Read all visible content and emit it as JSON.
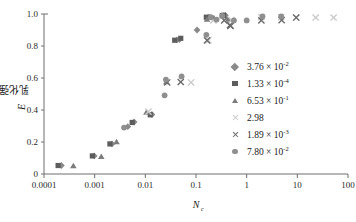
{
  "chart_data": {
    "type": "scatter",
    "title": "",
    "xlabel": "N",
    "xlabel_sub": "c",
    "ylabel": "乳化强度",
    "ylabel_italic": "E",
    "xscale": "log",
    "xlim": [
      0.0001,
      100
    ],
    "ylim": [
      0,
      1.0
    ],
    "grid": false,
    "legend_position": "right-middle",
    "xticks": [
      "0.0001",
      "0.001",
      "0.01",
      "0.1",
      "1",
      "10",
      "100"
    ],
    "xtick_values": [
      0.0001,
      0.001,
      0.01,
      0.1,
      1,
      10,
      100
    ],
    "yticks": [
      "0",
      "0.2",
      "0.4",
      "0.6",
      "0.8",
      "1.0"
    ],
    "ytick_values": [
      0,
      0.2,
      0.4,
      0.6,
      0.8,
      1.0
    ],
    "series": [
      {
        "name": "3.76 × 10⁻²",
        "mantissa": "3.76",
        "exponent": "-2",
        "marker": "diamond",
        "color": "#8a8a8a",
        "points": [
          [
            0.00022,
            0.053
          ],
          [
            0.00098,
            0.113
          ],
          [
            0.0022,
            0.188
          ],
          [
            0.0045,
            0.296
          ],
          [
            0.006,
            0.325
          ],
          [
            0.0135,
            0.372
          ],
          [
            0.042,
            0.838
          ],
          [
            0.047,
            0.84
          ],
          [
            0.105,
            0.9
          ],
          [
            0.175,
            0.98
          ],
          [
            0.345,
            0.99
          ],
          [
            0.38,
            0.992
          ]
        ]
      },
      {
        "name": "1.33 × 10⁻⁴",
        "mantissa": "1.33",
        "exponent": "-4",
        "marker": "square",
        "color": "#5d5d5d",
        "points": [
          [
            0.00019,
            0.053
          ],
          [
            0.0009,
            0.113
          ],
          [
            0.002,
            0.188
          ],
          [
            0.0055,
            0.322
          ],
          [
            0.0125,
            0.37
          ],
          [
            0.038,
            0.836
          ],
          [
            0.05,
            0.848
          ],
          [
            0.16,
            0.98
          ],
          [
            0.33,
            0.99
          ],
          [
            0.35,
            0.992
          ]
        ]
      },
      {
        "name": "6.53 × 10⁻¹",
        "mantissa": "6.53",
        "exponent": "-1",
        "marker": "triangle",
        "color": "#7c7c7c",
        "points": [
          [
            0.00038,
            0.05
          ],
          [
            0.00135,
            0.108
          ],
          [
            0.0027,
            0.2
          ],
          [
            0.0105,
            0.385
          ],
          [
            0.026,
            0.575
          ],
          [
            0.165,
            0.965
          ],
          [
            0.19,
            0.982
          ],
          [
            0.225,
            0.975
          ],
          [
            0.43,
            0.965
          ]
        ]
      },
      {
        "name": "2.98",
        "mantissa": "2.98",
        "exponent": "",
        "marker": "cross",
        "color": "#c9c9c9",
        "points": [
          [
            0.0115,
            0.39
          ],
          [
            0.08,
            0.572
          ],
          [
            0.175,
            0.835
          ],
          [
            0.22,
            0.96
          ],
          [
            0.5,
            0.962
          ],
          [
            1.95,
            0.98
          ],
          [
            4.8,
            0.98
          ],
          [
            9.5,
            0.978
          ],
          [
            23.0,
            0.978
          ],
          [
            52.0,
            0.978
          ]
        ]
      },
      {
        "name": "1.89 × 10⁻³",
        "mantissa": "1.89",
        "exponent": "-3",
        "marker": "cross",
        "color": "#6a6a6a",
        "points": [
          [
            0.027,
            0.572
          ],
          [
            0.05,
            0.575
          ],
          [
            0.165,
            0.835
          ],
          [
            0.36,
            0.96
          ],
          [
            0.47,
            0.93
          ],
          [
            0.48,
            0.925
          ],
          [
            1.95,
            0.96
          ],
          [
            4.9,
            0.962
          ],
          [
            9.5,
            0.978
          ]
        ]
      },
      {
        "name": "7.80 × 10⁻²",
        "mantissa": "7.80",
        "exponent": "-2",
        "marker": "circle",
        "color": "#8f8f8f",
        "points": [
          [
            0.0038,
            0.29
          ],
          [
            0.024,
            0.492
          ],
          [
            0.0255,
            0.59
          ],
          [
            0.052,
            0.61
          ],
          [
            0.16,
            0.87
          ],
          [
            0.195,
            0.98
          ],
          [
            0.255,
            0.965
          ],
          [
            0.33,
            0.988
          ],
          [
            0.56,
            0.96
          ],
          [
            1.0,
            0.96
          ],
          [
            2.05,
            0.985
          ],
          [
            4.8,
            0.985
          ]
        ]
      }
    ]
  }
}
